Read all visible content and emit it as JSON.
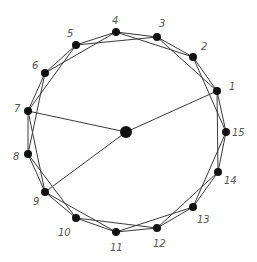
{
  "diagram": {
    "type": "graph",
    "colors": {
      "edge": "#3a3a3a",
      "node": "#111111",
      "label": "#555555",
      "background": "#ffffff"
    },
    "center": {
      "id": "hub",
      "x": 126,
      "y": 132,
      "r": 6
    },
    "nodes": [
      {
        "id": "1",
        "label": "1",
        "x": 217,
        "y": 91,
        "lx": 229,
        "ly": 90
      },
      {
        "id": "2",
        "label": "2",
        "x": 193,
        "y": 57,
        "lx": 201,
        "ly": 50
      },
      {
        "id": "3",
        "label": "3",
        "x": 157,
        "y": 37,
        "lx": 159,
        "ly": 27
      },
      {
        "id": "4",
        "label": "4",
        "x": 116,
        "y": 32,
        "lx": 112,
        "ly": 24
      },
      {
        "id": "5",
        "label": "5",
        "x": 76,
        "y": 45,
        "lx": 67,
        "ly": 37
      },
      {
        "id": "6",
        "label": "6",
        "x": 45,
        "y": 73,
        "lx": 32,
        "ly": 69
      },
      {
        "id": "7",
        "label": "7",
        "x": 28,
        "y": 111,
        "lx": 14,
        "ly": 112
      },
      {
        "id": "8",
        "label": "8",
        "x": 28,
        "y": 154,
        "lx": 13,
        "ly": 160
      },
      {
        "id": "9",
        "label": "9",
        "x": 45,
        "y": 192,
        "lx": 33,
        "ly": 205
      },
      {
        "id": "10",
        "label": "10",
        "x": 76,
        "y": 218,
        "lx": 58,
        "ly": 236
      },
      {
        "id": "11",
        "label": "11",
        "x": 116,
        "y": 232,
        "lx": 110,
        "ly": 251
      },
      {
        "id": "12",
        "label": "12",
        "x": 157,
        "y": 228,
        "lx": 153,
        "ly": 247
      },
      {
        "id": "13",
        "label": "13",
        "x": 193,
        "y": 207,
        "lx": 197,
        "ly": 223
      },
      {
        "id": "14",
        "label": "14",
        "x": 218,
        "y": 172,
        "lx": 224,
        "ly": 184
      },
      {
        "id": "15",
        "label": "15",
        "x": 226,
        "y": 132,
        "lx": 232,
        "ly": 136
      }
    ],
    "ring_offsets": [
      1,
      2
    ],
    "hub_edges": [
      "1",
      "7",
      "9"
    ]
  }
}
